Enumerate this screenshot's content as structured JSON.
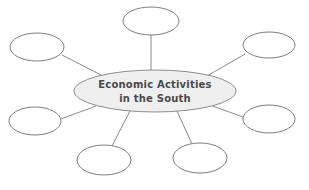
{
  "diagram": {
    "type": "concept-map",
    "title": "Economic Activities in the South",
    "canvas": {
      "width": 309,
      "height": 190,
      "background": "#ffffff"
    },
    "colors": {
      "center_fill": "#efefef",
      "center_stroke": "#8d8d8d",
      "node_fill": "#ffffff",
      "node_stroke": "#7d7d7d",
      "line_stroke": "#8a8a8a",
      "text": "#4a4a4a"
    },
    "center_node": {
      "label_line_1": "Economic Activities",
      "label_line_2": "in the South",
      "cx": 155,
      "cy": 91,
      "rx": 81,
      "ry": 21
    },
    "outer_nodes": [
      {
        "id": "top-center",
        "label": "",
        "cx": 151,
        "cy": 21,
        "rx": 28,
        "ry": 14
      },
      {
        "id": "top-left",
        "label": "",
        "cx": 37,
        "cy": 47,
        "rx": 27,
        "ry": 14
      },
      {
        "id": "top-right",
        "label": "",
        "cx": 269,
        "cy": 45,
        "rx": 26,
        "ry": 13
      },
      {
        "id": "left-middle",
        "label": "",
        "cx": 35,
        "cy": 121,
        "rx": 26,
        "ry": 14
      },
      {
        "id": "right-middle",
        "label": "",
        "cx": 269,
        "cy": 119,
        "rx": 26,
        "ry": 14
      },
      {
        "id": "bottom-left",
        "label": "",
        "cx": 104,
        "cy": 160,
        "rx": 27,
        "ry": 15
      },
      {
        "id": "bottom-right",
        "label": "",
        "cx": 200,
        "cy": 158,
        "rx": 27,
        "ry": 15
      }
    ],
    "connectors": [
      {
        "id": "connector-top-center",
        "x1": 151,
        "y1": 35,
        "x2": 151,
        "y2": 71
      },
      {
        "id": "connector-top-left",
        "x1": 62,
        "y1": 55,
        "x2": 103,
        "y2": 76
      },
      {
        "id": "connector-top-right",
        "x1": 245,
        "y1": 54,
        "x2": 207,
        "y2": 76
      },
      {
        "id": "connector-left-middle",
        "x1": 61,
        "y1": 119,
        "x2": 96,
        "y2": 106
      },
      {
        "id": "connector-right-middle",
        "x1": 243,
        "y1": 117,
        "x2": 210,
        "y2": 105
      },
      {
        "id": "connector-bottom-left",
        "x1": 112,
        "y1": 146,
        "x2": 130,
        "y2": 111
      },
      {
        "id": "connector-bottom-right",
        "x1": 192,
        "y1": 144,
        "x2": 177,
        "y2": 111
      }
    ]
  }
}
